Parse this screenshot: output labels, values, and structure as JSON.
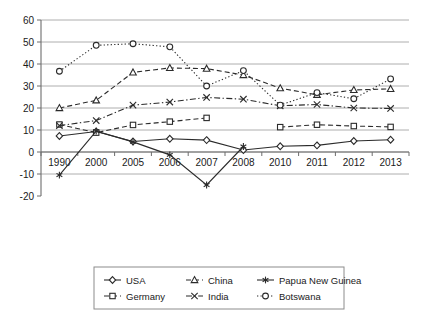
{
  "chart_data": {
    "type": "line",
    "title": "",
    "subtitle": "",
    "xlabel": "",
    "ylabel": "",
    "categories": [
      "1990",
      "2000",
      "2005",
      "2006",
      "2007",
      "2008",
      "2010",
      "2011",
      "2012",
      "2013"
    ],
    "ylim": [
      -20,
      60
    ],
    "yticks": [
      -20,
      -10,
      0,
      10,
      20,
      30,
      40,
      50,
      60
    ],
    "ytick_labels": [
      "-20",
      "-10",
      "0",
      "10",
      "20",
      "30",
      "40",
      "50",
      "60"
    ],
    "grid": "horizontal",
    "legend_position": "bottom",
    "series": [
      {
        "name": "USA",
        "marker": "open-diamond",
        "line_style": "solid",
        "values": [
          7.3,
          9.3,
          4.8,
          6.0,
          5.4,
          0.9,
          2.6,
          3.0,
          5.0,
          5.6
        ]
      },
      {
        "name": "Germany",
        "marker": "open-square",
        "line_style": "dashed",
        "values": [
          12.5,
          8.8,
          12.3,
          13.8,
          15.5,
          null,
          11.3,
          12.4,
          11.8,
          11.4
        ]
      },
      {
        "name": "China",
        "marker": "open-triangle",
        "line_style": "dashed",
        "values": [
          20.0,
          23.5,
          36.2,
          38.2,
          37.9,
          35.0,
          29.0,
          26.0,
          28.2,
          28.7
        ]
      },
      {
        "name": "India",
        "marker": "cross-x",
        "line_style": "dash-dot",
        "values": [
          12.0,
          14.3,
          21.3,
          22.7,
          24.8,
          24.0,
          21.0,
          21.6,
          20.0,
          19.8
        ]
      },
      {
        "name": "Papua New Guinea",
        "marker": "asterisk",
        "line_style": "solid",
        "values": [
          -10.5,
          9.5,
          4.6,
          -1.3,
          -15.0,
          2.5,
          null,
          null,
          null,
          null
        ]
      },
      {
        "name": "Botswana",
        "marker": "open-circle",
        "line_style": "dotted",
        "values": [
          36.7,
          48.5,
          49.2,
          47.8,
          30.0,
          37.0,
          21.3,
          27.0,
          24.2,
          33.2
        ]
      }
    ],
    "legend": [
      {
        "label": "USA",
        "marker": "open-diamond",
        "line_style": "solid"
      },
      {
        "label": "China",
        "marker": "open-triangle",
        "line_style": "dashed"
      },
      {
        "label": "Papua New Guinea",
        "marker": "asterisk",
        "line_style": "solid"
      },
      {
        "label": "Germany",
        "marker": "open-square",
        "line_style": "dashed"
      },
      {
        "label": "India",
        "marker": "cross-x",
        "line_style": "dash-dot"
      },
      {
        "label": "Botswana",
        "marker": "open-circle",
        "line_style": "dotted"
      }
    ],
    "colors": {
      "line": "#2b2b2b",
      "grid": "#9a9a9a",
      "axis": "#6d6d6d",
      "text": "#1a1a1a",
      "background": "#ffffff"
    }
  }
}
